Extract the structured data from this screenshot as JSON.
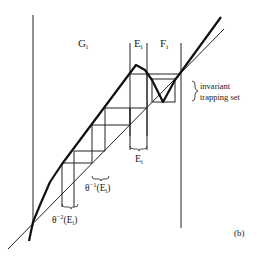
{
  "figure": {
    "panel_label": "(b)",
    "regions": {
      "G": "G",
      "E": "E",
      "F": "F",
      "subscript": "i"
    },
    "annotations": {
      "trapping_line1": "invariant",
      "trapping_line2": "trapping set",
      "E_bottom": "E",
      "theta": "θ",
      "inv1_exp": "−1",
      "inv2_exp": "−2",
      "paren_open": "(E",
      "paren_close": ")"
    }
  }
}
